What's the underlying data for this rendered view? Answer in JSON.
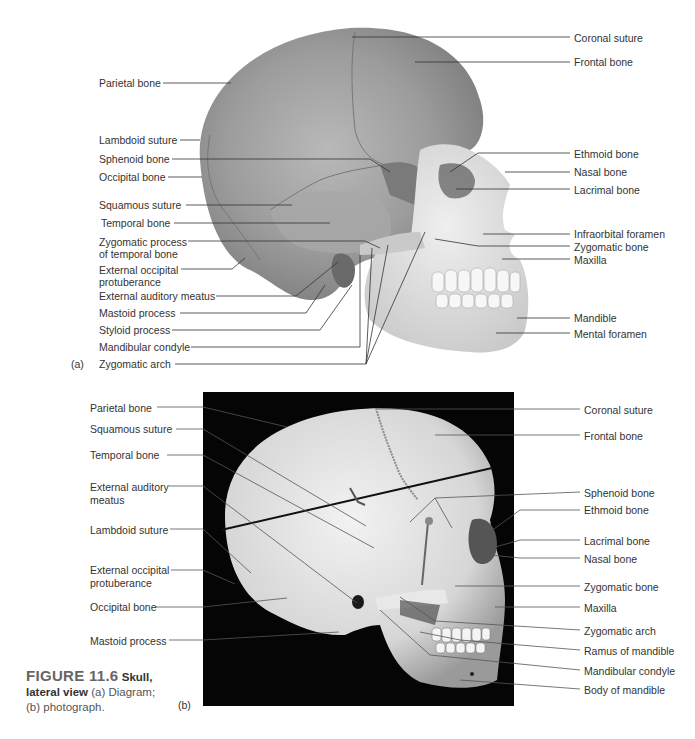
{
  "figure": {
    "number": "FIGURE 11.6",
    "title_part1": "Skull,",
    "title_part2": "lateral view",
    "desc1": "(a) Diagram;",
    "desc2": "(b) photograph."
  },
  "panel_a": {
    "tag": "(a)",
    "left_labels": [
      "Parietal bone",
      "Lambdoid suture",
      "Sphenoid bone",
      "Occipital bone",
      "Squamous suture",
      "Temporal bone",
      "Zygomatic process",
      "of temporal bone",
      "External occipital",
      "protuberance",
      "External auditory meatus",
      "Mastoid process",
      "Styloid process",
      "Mandibular condyle",
      "Zygomatic arch"
    ],
    "right_labels": [
      "Coronal suture",
      "Frontal bone",
      "Ethmoid bone",
      "Nasal bone",
      "Lacrimal bone",
      "Infraorbital foramen",
      "Zygomatic bone",
      "Maxilla",
      "Mandible",
      "Mental foramen"
    ]
  },
  "panel_b": {
    "tag": "(b)",
    "left_labels": [
      "Parietal bone",
      "Squamous suture",
      "Temporal bone",
      "External auditory",
      "meatus",
      "Lambdoid suture",
      "External occipital",
      "protuberance",
      "Occipital bone",
      "Mastoid process"
    ],
    "right_labels": [
      "Coronal suture",
      "Frontal bone",
      "Sphenoid bone",
      "Ethmoid bone",
      "Lacrimal bone",
      "Nasal bone",
      "Zygomatic bone",
      "Maxilla",
      "Zygomatic arch",
      "Ramus of mandible",
      "Mandibular condyle",
      "Body of mandible"
    ]
  }
}
